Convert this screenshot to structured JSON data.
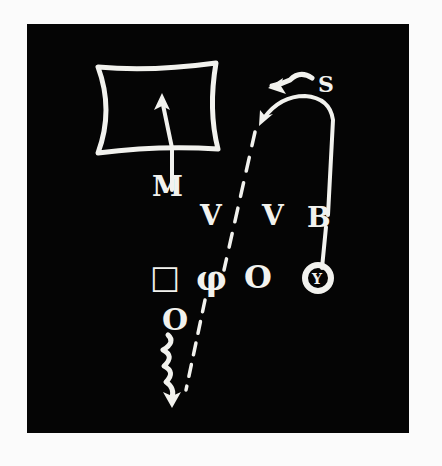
{
  "colors": {
    "board": "#050505",
    "chalk": "#f2f2ee",
    "page": "#fbfbfb"
  },
  "defense": {
    "linebacker_label": "M",
    "safety_label": "S",
    "lineman_markers": [
      "V",
      "V"
    ],
    "end_marker": "B",
    "zone": "rectangle-zone"
  },
  "offense": {
    "players": [
      "□",
      "φ",
      "O",
      "Y"
    ],
    "back_symbol": "O"
  },
  "routes": [
    {
      "name": "linebacker-drop",
      "description": "M drops upward into zone box"
    },
    {
      "name": "safety-rotation",
      "description": "S curls left"
    },
    {
      "name": "end-wheel",
      "description": "B/Y runs up and curls back left"
    },
    {
      "name": "dashed-pass-lane",
      "description": "dashed line from φ toward top"
    },
    {
      "name": "back-squiggle-run",
      "description": "squiggly run downward with arrow"
    }
  ]
}
